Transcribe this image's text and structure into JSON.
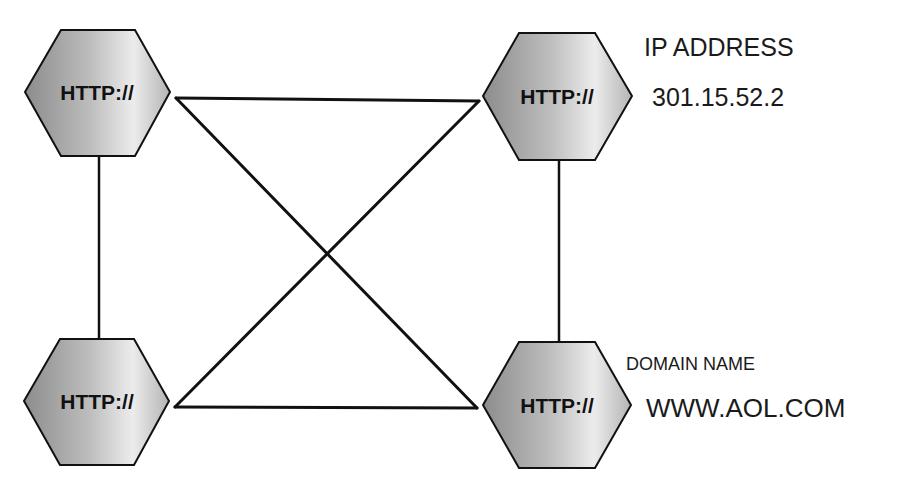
{
  "diagram": {
    "nodes": [
      {
        "id": "top-left",
        "label": "HTTP://"
      },
      {
        "id": "top-right",
        "label": "HTTP://"
      },
      {
        "id": "bottom-left",
        "label": "HTTP://"
      },
      {
        "id": "bottom-right",
        "label": "HTTP://"
      }
    ],
    "edges": [
      {
        "from": "top-left",
        "to": "top-right"
      },
      {
        "from": "top-left",
        "to": "bottom-left"
      },
      {
        "from": "top-right",
        "to": "bottom-right"
      },
      {
        "from": "bottom-left",
        "to": "bottom-right"
      },
      {
        "from": "top-left",
        "to": "bottom-right"
      },
      {
        "from": "top-right",
        "to": "bottom-left"
      }
    ],
    "annotations": {
      "ip_heading": "IP ADDRESS",
      "ip_value": "301.15.52.2",
      "domain_heading": "DOMAIN NAME",
      "domain_value": "WWW.AOL.COM"
    },
    "colors": {
      "stroke": "#111111",
      "hex_light": "#f2f2f2",
      "hex_dark": "#8a8a8a"
    }
  }
}
